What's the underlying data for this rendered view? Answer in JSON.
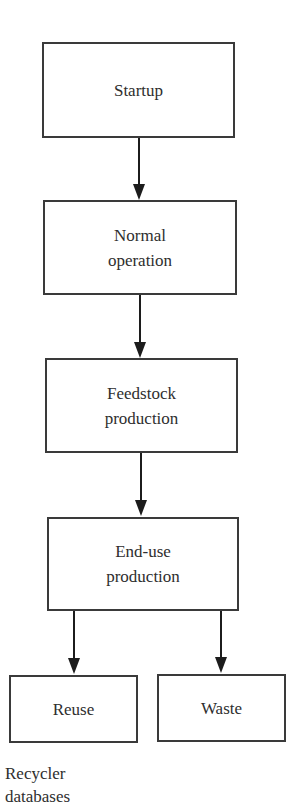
{
  "diagram": {
    "type": "flowchart",
    "nodes": [
      {
        "id": "startup",
        "label": "Startup"
      },
      {
        "id": "normal_operation",
        "label": "Normal\noperation"
      },
      {
        "id": "feedstock_production",
        "label": "Feedstock\nproduction"
      },
      {
        "id": "end_use_production",
        "label": "End-use\nproduction"
      },
      {
        "id": "reuse",
        "label": "Reuse"
      },
      {
        "id": "waste",
        "label": "Waste"
      }
    ],
    "edges": [
      {
        "from": "startup",
        "to": "normal_operation"
      },
      {
        "from": "normal_operation",
        "to": "feedstock_production"
      },
      {
        "from": "feedstock_production",
        "to": "end_use_production"
      },
      {
        "from": "end_use_production",
        "to": "reuse"
      },
      {
        "from": "end_use_production",
        "to": "waste"
      }
    ],
    "caption": "Recycler\ndatabases"
  }
}
